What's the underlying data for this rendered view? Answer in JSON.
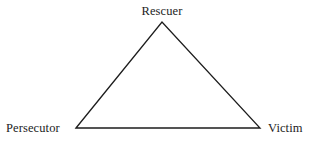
{
  "diagram": {
    "type": "triangle",
    "background_color": "#ffffff",
    "stroke_color": "#1d1d1d",
    "stroke_width": 1.3,
    "text_color": "#1d1d1d",
    "vertices": [
      {
        "id": "rescuer",
        "label": "Rescuer",
        "x": 162,
        "y": 22,
        "label_position": "above"
      },
      {
        "id": "persecutor",
        "label": "Persecutor",
        "x": 76,
        "y": 128,
        "label_position": "left"
      },
      {
        "id": "victim",
        "label": "Victim",
        "x": 260,
        "y": 128,
        "label_position": "right"
      }
    ],
    "edges": [
      {
        "from": "persecutor",
        "to": "rescuer"
      },
      {
        "from": "rescuer",
        "to": "victim"
      },
      {
        "from": "persecutor",
        "to": "victim"
      }
    ],
    "polygon_points": "76,128 162,22 260,128"
  }
}
